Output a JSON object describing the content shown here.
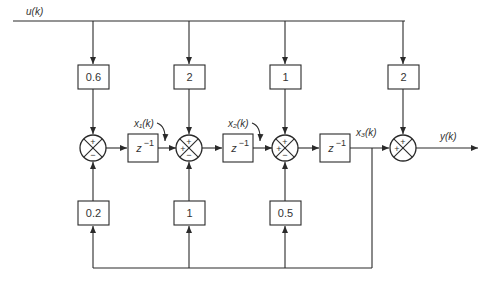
{
  "diagram": {
    "type": "state-space block diagram (discrete-time)",
    "input_label": "u(k)",
    "output_label": "y(k)",
    "feedforward_gains": [
      "0.6",
      "2",
      "1",
      "2"
    ],
    "feedback_gains": [
      "0.2",
      "1",
      "0.5"
    ],
    "delay_label": "z",
    "delay_exponent": "−1",
    "state_labels": [
      "x₁(k)",
      "x₂(k)",
      "x₃(k)"
    ],
    "junctions": [
      {
        "top": "+",
        "left": "",
        "bottom": "−"
      },
      {
        "top": "+",
        "left": "+",
        "bottom": "−"
      },
      {
        "top": "+",
        "left": "+",
        "bottom": "−"
      },
      {
        "top": "+",
        "left": "+",
        "bottom": ""
      }
    ]
  }
}
